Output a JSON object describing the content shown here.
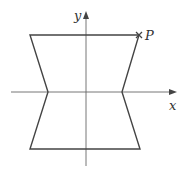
{
  "figure": {
    "type": "coordinate-diagram",
    "axes": {
      "x_label": "x",
      "y_label": "y",
      "origin": [
        86,
        92
      ],
      "x_axis": {
        "from": [
          11,
          92
        ],
        "to": [
          176,
          92
        ]
      },
      "y_axis": {
        "from": [
          86,
          166
        ],
        "to": [
          86,
          12
        ]
      }
    },
    "shape": {
      "description": "hexagon (hourglass-like) symmetric about y-axis",
      "vertices": [
        [
          30,
          35
        ],
        [
          139,
          35
        ],
        [
          122,
          92
        ],
        [
          140,
          149
        ],
        [
          30,
          149
        ],
        [
          48,
          92
        ]
      ],
      "stroke": "#444444"
    },
    "point": {
      "label": "P",
      "marker": "x-mark",
      "position": [
        139,
        35
      ]
    }
  }
}
